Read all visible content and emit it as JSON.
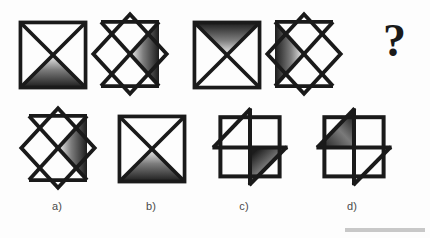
{
  "puzzle": {
    "type": "visual-analogy-sequence",
    "background_color": "#fdfdfd",
    "stroke_color": "#1a1a1a",
    "gradient_dark": "#1c1c1c",
    "gradient_light": "#f2f2f2",
    "question_mark": "?"
  },
  "sequence": {
    "name": "top-row-sequence",
    "items": [
      {
        "index": 1,
        "name": "figure-square-x-bottom-shaded",
        "shape": "square-with-x",
        "rotation_deg": 0,
        "shaded_triangle": "bottom",
        "gradient_direction": "dark-at-outer-edge"
      },
      {
        "index": 2,
        "name": "figure-diamond-x-right-shaded",
        "shape": "diamond-with-x",
        "rotation_deg": 45,
        "shaded_triangle": "right",
        "gradient_direction": "dark-at-outer-edge"
      },
      {
        "index": 3,
        "name": "figure-square-x-top-shaded",
        "shape": "square-with-x",
        "rotation_deg": 0,
        "shaded_triangle": "top",
        "gradient_direction": "dark-at-outer-edge"
      },
      {
        "index": 4,
        "name": "figure-diamond-x-left-shaded",
        "shape": "diamond-with-x",
        "rotation_deg": 45,
        "shaded_triangle": "left",
        "gradient_direction": "dark-at-outer-edge"
      },
      {
        "index": 5,
        "name": "figure-unknown",
        "shape": "question-mark",
        "rotation_deg": 0,
        "shaded_triangle": "none",
        "gradient_direction": "none"
      }
    ]
  },
  "options": {
    "name": "answer-options-row",
    "items": [
      {
        "key": "a",
        "label": "a)",
        "name": "option-a",
        "shape": "diamond-with-x",
        "shaded_triangle": "right"
      },
      {
        "key": "b",
        "label": "b)",
        "name": "option-b",
        "shape": "square-with-x",
        "shaded_triangle": "bottom"
      },
      {
        "key": "c",
        "label": "c)",
        "name": "option-c",
        "shape": "square-with-pinwheel",
        "shaded_triangle": "lower-right"
      },
      {
        "key": "d",
        "label": "d)",
        "name": "option-d",
        "shape": "square-with-pinwheel",
        "shaded_triangle": "upper-left"
      }
    ]
  }
}
